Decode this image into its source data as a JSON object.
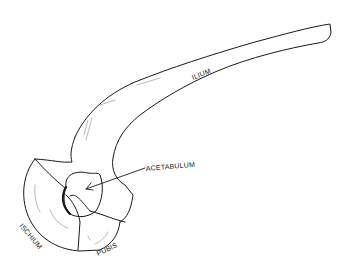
{
  "diagram": {
    "labels": {
      "ilium": "ILIUM",
      "acetabulum": "ACETABULUM",
      "ischium": "ISCHIUM",
      "pubis": "PUBIS"
    },
    "colors": {
      "line": "#1a1a1a",
      "shading": "#8a8a8a",
      "background": "#ffffff"
    }
  }
}
